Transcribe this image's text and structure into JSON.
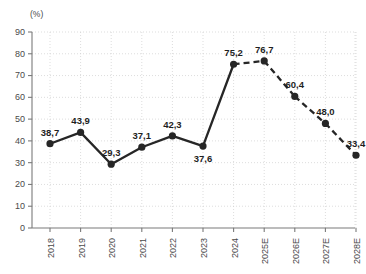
{
  "chart_data": {
    "type": "line",
    "title": "",
    "subtitle": "",
    "xlabel": "",
    "ylabel": "",
    "unit_label": "(%)",
    "categories": [
      "2018",
      "2019",
      "2020",
      "2021",
      "2022",
      "2023",
      "2024",
      "2025E",
      "2026E",
      "2027E",
      "2028E"
    ],
    "values": [
      38.7,
      43.9,
      29.3,
      37.1,
      42.3,
      37.6,
      75.2,
      76.7,
      60.4,
      48.0,
      33.4
    ],
    "point_labels": [
      "38,7",
      "43,9",
      "29,3",
      "37,1",
      "42,3",
      "37,6",
      "75,2",
      "76,7",
      "60,4",
      "48,0",
      "33,4"
    ],
    "label_positions": [
      "above",
      "above",
      "above",
      "above",
      "above",
      "below",
      "above",
      "above",
      "above",
      "above",
      "above"
    ],
    "segment_styles": [
      "solid",
      "solid",
      "solid",
      "solid",
      "solid",
      "solid",
      "dashed",
      "dashed",
      "dashed",
      "dashed"
    ],
    "actual_count": 7,
    "forecast_count": 4,
    "ylim": [
      0,
      90
    ],
    "yticks": [
      0,
      10,
      20,
      30,
      40,
      50,
      60,
      70,
      80,
      90
    ],
    "ytick_labels": [
      "0",
      "10",
      "20",
      "30",
      "40",
      "50",
      "60",
      "70",
      "80",
      "90"
    ],
    "grid": true,
    "grid_axes": "both",
    "legend": "none",
    "colors": {
      "series": "#262626",
      "grid": "#cfcfcf",
      "axis": "#7a7a7a",
      "text": "#4a4a4a",
      "label_text": "#1f1f1f",
      "background": "#ffffff"
    }
  }
}
